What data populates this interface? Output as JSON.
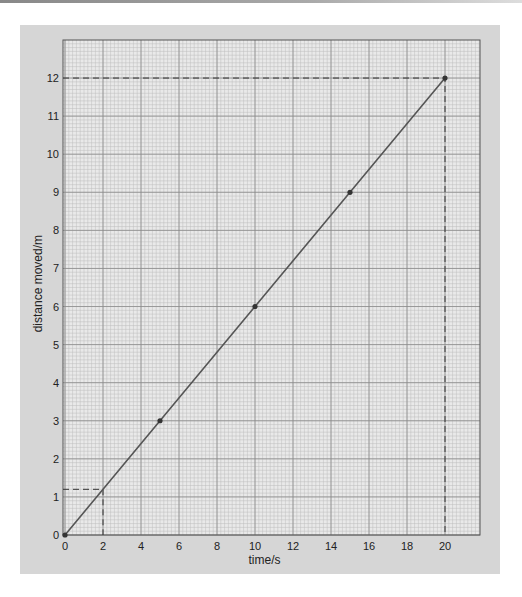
{
  "chart_data": {
    "type": "line",
    "title": "",
    "xlabel": "time/s",
    "ylabel": "distance moved/m",
    "xlim": [
      0,
      22
    ],
    "ylim": [
      0,
      12.5
    ],
    "x_ticks": [
      0,
      2,
      4,
      6,
      8,
      10,
      12,
      14,
      16,
      18,
      20
    ],
    "y_ticks": [
      0,
      1,
      2,
      3,
      4,
      5,
      6,
      7,
      8,
      9,
      10,
      11,
      12
    ],
    "grid": true,
    "series": [
      {
        "name": "distance",
        "x": [
          0,
          5,
          10,
          15,
          20
        ],
        "y": [
          0,
          3,
          6,
          9,
          12
        ],
        "color": "#555555"
      }
    ],
    "annotations": [
      {
        "type": "dashed-guide",
        "x": 2,
        "y": 1.2
      },
      {
        "type": "dashed-guide",
        "x": 20,
        "y": 12
      }
    ]
  },
  "colors": {
    "panel": "#d6d6d6",
    "grid_bg": "#e9e9e9",
    "minor_grid": "#bdbdbd",
    "major_grid": "#8a8a8a",
    "line": "#555555"
  }
}
